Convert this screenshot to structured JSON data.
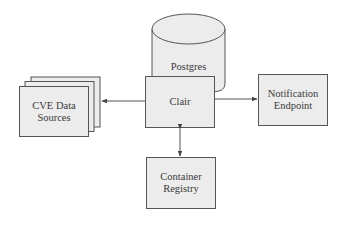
{
  "diagram": {
    "type": "architecture",
    "nodes": {
      "postgres": {
        "label": "Postgres",
        "shape": "cylinder"
      },
      "clair": {
        "label": "Clair",
        "shape": "box"
      },
      "cve_sources": {
        "label_line1": "CVE Data",
        "label_line2": "Sources",
        "shape": "stacked-box"
      },
      "notification": {
        "label_line1": "Notification",
        "label_line2": "Endpoint",
        "shape": "box"
      },
      "registry": {
        "label_line1": "Container",
        "label_line2": "Registry",
        "shape": "box"
      }
    },
    "edges": [
      {
        "from": "clair",
        "to": "cve_sources",
        "direction": "one-way"
      },
      {
        "from": "clair",
        "to": "notification",
        "direction": "one-way"
      },
      {
        "from": "clair",
        "to": "registry",
        "direction": "two-way"
      }
    ],
    "colors": {
      "fill": "#ececec",
      "stroke": "#555555",
      "background": "#ffffff"
    }
  }
}
